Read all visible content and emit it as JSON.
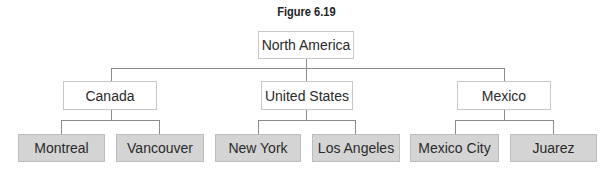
{
  "figure": {
    "title": "Figure 6.19"
  },
  "tree": {
    "root": {
      "label": "North America"
    },
    "level1": [
      {
        "label": "Canada"
      },
      {
        "label": "United States"
      },
      {
        "label": "Mexico"
      }
    ],
    "level2": [
      {
        "label": "Montreal",
        "parent": "Canada"
      },
      {
        "label": "Vancouver",
        "parent": "Canada"
      },
      {
        "label": "New York",
        "parent": "United States"
      },
      {
        "label": "Los Angeles",
        "parent": "United States"
      },
      {
        "label": "Mexico City",
        "parent": "Mexico"
      },
      {
        "label": "Juarez",
        "parent": "Mexico"
      }
    ]
  },
  "colors": {
    "box_white": "#ffffff",
    "box_gray": "#d4d4d4",
    "connector": "#8c8c8c"
  }
}
